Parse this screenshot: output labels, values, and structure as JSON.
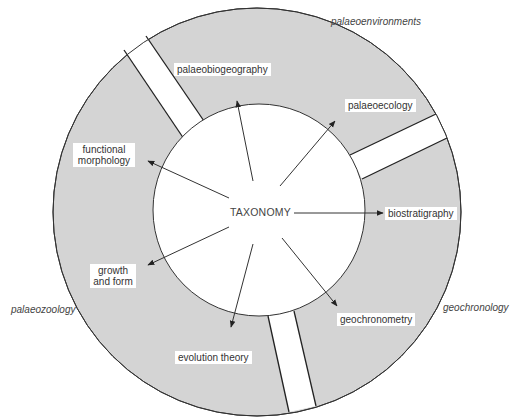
{
  "diagram": {
    "title": "",
    "colors": {
      "ring_fill": "#d4d4d4",
      "stroke": "#333333",
      "background": "#ffffff"
    },
    "center_label": "TAXONOMY",
    "outer_labels": {
      "top_right": "palaeoenvironments",
      "right": "geochronology",
      "left": "palaeozoology"
    },
    "inner_labels": {
      "palaeobiogeography": "palaeobiogeography",
      "palaeoecology": "palaeoecology",
      "functional_morphology_1": "functional",
      "functional_morphology_2": "morphology",
      "biostratigraphy": "biostratigraphy",
      "growth_and_form_1": "growth",
      "growth_and_form_2": "and form",
      "geochronometry": "geochronometry",
      "evolution_theory": "evolution theory"
    }
  }
}
